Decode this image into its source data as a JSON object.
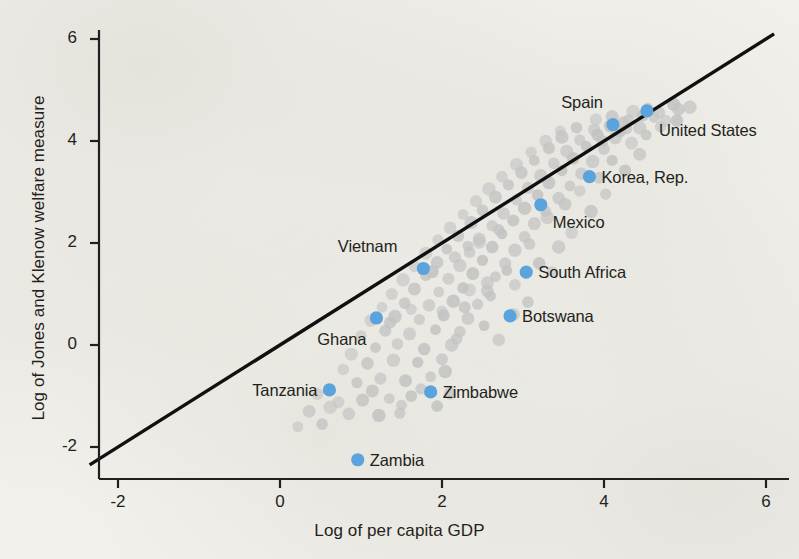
{
  "chart_data": {
    "type": "scatter",
    "title": "",
    "xlabel": "Log of per capita GDP",
    "ylabel": "Log of Jones and Klenow welfare measure",
    "xlim": [
      -2.35,
      6.4
    ],
    "ylim": [
      -2.75,
      6.45
    ],
    "xticks": [
      -2,
      0,
      2,
      4,
      6
    ],
    "xticklabels": [
      "-2",
      "0",
      "2",
      "4",
      "6"
    ],
    "yticks": [
      -2,
      0,
      2,
      4,
      6
    ],
    "yticklabels": [
      "-2",
      "0",
      "2",
      "4",
      "6"
    ],
    "grid": false,
    "legend": "none",
    "colors": {
      "background": "#f2f1ec",
      "highlight_point": "#5ba3dd",
      "other_point": "#c3c3c3",
      "reference_line": "#101010",
      "text": "#231f20"
    },
    "reference_line": {
      "description": "45-degree line y = x",
      "slope": 1,
      "intercept": 0,
      "x_from": -2.35,
      "x_to": 6.1
    },
    "highlighted": [
      {
        "name": "Spain",
        "x": 4.11,
        "y": 4.32,
        "label_dx": -10,
        "label_dy": -22,
        "label_anchor": "end"
      },
      {
        "name": "United States",
        "x": 4.53,
        "y": 4.59,
        "label_dx": 12,
        "label_dy": 20,
        "label_anchor": "start"
      },
      {
        "name": "Korea, Rep.",
        "x": 3.82,
        "y": 3.3,
        "label_dx": 12,
        "label_dy": 1,
        "label_anchor": "start"
      },
      {
        "name": "Mexico",
        "x": 3.22,
        "y": 2.75,
        "label_dx": 12,
        "label_dy": 18,
        "label_anchor": "start"
      },
      {
        "name": "South Africa",
        "x": 3.04,
        "y": 1.43,
        "label_dx": 12,
        "label_dy": 1,
        "label_anchor": "start"
      },
      {
        "name": "Botswana",
        "x": 2.84,
        "y": 0.57,
        "label_dx": 12,
        "label_dy": 1,
        "label_anchor": "start"
      },
      {
        "name": "Vietnam",
        "x": 1.77,
        "y": 1.5,
        "label_dx": -26,
        "label_dy": -22,
        "label_anchor": "end"
      },
      {
        "name": "Ghana",
        "x": 1.19,
        "y": 0.53,
        "label_dx": -10,
        "label_dy": 22,
        "label_anchor": "end"
      },
      {
        "name": "Tanzania",
        "x": 0.61,
        "y": -0.88,
        "label_dx": -12,
        "label_dy": 1,
        "label_anchor": "end"
      },
      {
        "name": "Zimbabwe",
        "x": 1.86,
        "y": -0.92,
        "label_dx": 12,
        "label_dy": 1,
        "label_anchor": "start"
      },
      {
        "name": "Zambia",
        "x": 0.96,
        "y": -2.25,
        "label_dx": 12,
        "label_dy": 1,
        "label_anchor": "start"
      }
    ],
    "other_points": [
      [
        0.22,
        -1.6
      ],
      [
        0.52,
        -1.55
      ],
      [
        0.85,
        -1.35
      ],
      [
        1.22,
        -1.38
      ],
      [
        1.48,
        -1.34
      ],
      [
        0.72,
        -1.12
      ],
      [
        1.02,
        -1.08
      ],
      [
        1.35,
        -1.05
      ],
      [
        1.62,
        -1.0
      ],
      [
        2.1,
        -0.95
      ],
      [
        0.62,
        -1.22
      ],
      [
        0.95,
        -0.74
      ],
      [
        1.24,
        -0.66
      ],
      [
        1.55,
        -0.7
      ],
      [
        1.86,
        -0.62
      ],
      [
        0.78,
        -0.48
      ],
      [
        1.08,
        -0.36
      ],
      [
        1.4,
        -0.3
      ],
      [
        1.7,
        -0.34
      ],
      [
        2.0,
        -0.28
      ],
      [
        0.88,
        -0.18
      ],
      [
        1.18,
        -0.05
      ],
      [
        1.45,
        0.02
      ],
      [
        1.78,
        -0.08
      ],
      [
        2.12,
        0.0
      ],
      [
        1.0,
        0.18
      ],
      [
        1.3,
        0.28
      ],
      [
        1.6,
        0.22
      ],
      [
        1.92,
        0.3
      ],
      [
        2.22,
        0.26
      ],
      [
        1.12,
        0.48
      ],
      [
        1.42,
        0.56
      ],
      [
        1.72,
        0.5
      ],
      [
        2.02,
        0.58
      ],
      [
        2.32,
        0.52
      ],
      [
        1.26,
        0.74
      ],
      [
        1.54,
        0.82
      ],
      [
        1.84,
        0.78
      ],
      [
        2.14,
        0.86
      ],
      [
        2.44,
        0.8
      ],
      [
        1.38,
        1.0
      ],
      [
        1.66,
        1.1
      ],
      [
        1.96,
        1.04
      ],
      [
        2.26,
        1.12
      ],
      [
        2.56,
        1.06
      ],
      [
        1.52,
        1.28
      ],
      [
        1.8,
        1.36
      ],
      [
        2.08,
        1.3
      ],
      [
        2.38,
        1.4
      ],
      [
        2.66,
        1.34
      ],
      [
        1.66,
        1.54
      ],
      [
        1.94,
        1.62
      ],
      [
        2.22,
        1.56
      ],
      [
        2.5,
        1.66
      ],
      [
        2.78,
        1.6
      ],
      [
        1.8,
        1.8
      ],
      [
        2.06,
        1.88
      ],
      [
        2.34,
        1.82
      ],
      [
        2.62,
        1.92
      ],
      [
        2.9,
        1.86
      ],
      [
        1.95,
        2.06
      ],
      [
        2.2,
        2.14
      ],
      [
        2.46,
        2.08
      ],
      [
        2.74,
        2.18
      ],
      [
        3.02,
        2.12
      ],
      [
        2.1,
        2.3
      ],
      [
        2.36,
        2.4
      ],
      [
        2.62,
        2.34
      ],
      [
        2.88,
        2.44
      ],
      [
        3.14,
        2.38
      ],
      [
        2.26,
        2.56
      ],
      [
        2.5,
        2.64
      ],
      [
        2.76,
        2.58
      ],
      [
        3.02,
        2.68
      ],
      [
        3.28,
        2.62
      ],
      [
        2.42,
        2.82
      ],
      [
        2.66,
        2.9
      ],
      [
        2.92,
        2.84
      ],
      [
        3.18,
        2.94
      ],
      [
        3.44,
        2.88
      ],
      [
        2.58,
        3.06
      ],
      [
        2.82,
        3.14
      ],
      [
        3.06,
        3.08
      ],
      [
        3.32,
        3.18
      ],
      [
        3.58,
        3.12
      ],
      [
        2.74,
        3.3
      ],
      [
        2.98,
        3.38
      ],
      [
        3.22,
        3.32
      ],
      [
        3.48,
        3.42
      ],
      [
        3.72,
        3.36
      ],
      [
        2.92,
        3.54
      ],
      [
        3.14,
        3.62
      ],
      [
        3.38,
        3.56
      ],
      [
        3.62,
        3.66
      ],
      [
        3.86,
        3.6
      ],
      [
        3.1,
        3.78
      ],
      [
        3.32,
        3.86
      ],
      [
        3.54,
        3.8
      ],
      [
        3.78,
        3.9
      ],
      [
        4.0,
        3.84
      ],
      [
        3.28,
        4.0
      ],
      [
        3.48,
        4.08
      ],
      [
        3.7,
        4.02
      ],
      [
        3.92,
        4.12
      ],
      [
        4.14,
        4.06
      ],
      [
        3.46,
        4.2
      ],
      [
        3.66,
        4.26
      ],
      [
        3.88,
        4.22
      ],
      [
        4.08,
        4.3
      ],
      [
        4.28,
        4.24
      ],
      [
        3.9,
        4.42
      ],
      [
        4.1,
        4.48
      ],
      [
        4.3,
        4.42
      ],
      [
        4.48,
        4.5
      ],
      [
        4.24,
        4.36
      ],
      [
        4.36,
        4.58
      ],
      [
        4.54,
        4.64
      ],
      [
        4.68,
        4.56
      ],
      [
        4.86,
        4.72
      ],
      [
        4.62,
        4.46
      ],
      [
        4.76,
        4.4
      ],
      [
        4.92,
        4.62
      ],
      [
        4.44,
        4.26
      ],
      [
        4.2,
        4.18
      ],
      [
        3.98,
        4.0
      ],
      [
        2.34,
        1.08
      ],
      [
        2.6,
        0.96
      ],
      [
        2.9,
        1.18
      ],
      [
        3.2,
        1.6
      ],
      [
        3.44,
        1.92
      ],
      [
        1.62,
        0.7
      ],
      [
        1.36,
        0.44
      ],
      [
        2.88,
        0.6
      ],
      [
        2.52,
        0.38
      ],
      [
        2.18,
        0.12
      ],
      [
        3.6,
        2.2
      ],
      [
        3.84,
        2.62
      ],
      [
        4.02,
        2.96
      ],
      [
        4.26,
        3.42
      ],
      [
        4.44,
        3.74
      ],
      [
        3.36,
        1.44
      ],
      [
        3.06,
        0.84
      ],
      [
        2.7,
        0.1
      ],
      [
        2.04,
        -0.52
      ],
      [
        1.74,
        -0.86
      ],
      [
        0.46,
        -0.96
      ],
      [
        1.14,
        -0.9
      ],
      [
        1.5,
        -1.18
      ],
      [
        1.94,
        -1.2
      ],
      [
        0.36,
        -1.3
      ],
      [
        2.46,
        2.02
      ],
      [
        2.7,
        2.26
      ],
      [
        2.16,
        1.72
      ],
      [
        1.88,
        1.44
      ],
      [
        2.32,
        1.94
      ],
      [
        3.7,
        3.02
      ],
      [
        3.52,
        2.76
      ],
      [
        3.3,
        2.5
      ],
      [
        4.1,
        3.62
      ],
      [
        3.94,
        3.28
      ],
      [
        4.34,
        3.96
      ],
      [
        4.52,
        4.12
      ],
      [
        4.7,
        4.28
      ],
      [
        4.9,
        4.4
      ],
      [
        5.06,
        4.66
      ],
      [
        2.0,
        0.66
      ],
      [
        2.28,
        0.74
      ],
      [
        2.56,
        1.22
      ],
      [
        2.8,
        1.46
      ],
      [
        3.08,
        1.98
      ]
    ]
  }
}
